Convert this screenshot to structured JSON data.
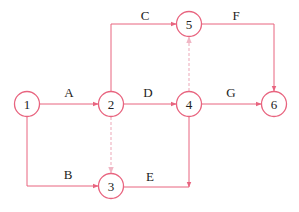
{
  "diagram": {
    "type": "activity-on-arrow network",
    "colors": {
      "stroke": "#e8647f",
      "dummy": "#f0b6c4",
      "text": "#222222"
    },
    "nodes": [
      {
        "id": "1",
        "label": "1",
        "x": 27,
        "y": 104
      },
      {
        "id": "2",
        "label": "2",
        "x": 111,
        "y": 104
      },
      {
        "id": "3",
        "label": "3",
        "x": 111,
        "y": 186
      },
      {
        "id": "4",
        "label": "4",
        "x": 189,
        "y": 104
      },
      {
        "id": "5",
        "label": "5",
        "x": 189,
        "y": 24
      },
      {
        "id": "6",
        "label": "6",
        "x": 274,
        "y": 104
      }
    ],
    "edges": [
      {
        "label": "A",
        "from": "1",
        "to": "2",
        "style": "solid"
      },
      {
        "label": "B",
        "from": "1",
        "to": "3",
        "style": "solid"
      },
      {
        "label": "C",
        "from": "2",
        "to": "5",
        "style": "solid"
      },
      {
        "label": "D",
        "from": "2",
        "to": "4",
        "style": "solid"
      },
      {
        "label": "E",
        "from": "3",
        "to": "4",
        "style": "solid"
      },
      {
        "label": "F",
        "from": "5",
        "to": "6",
        "style": "solid"
      },
      {
        "label": "G",
        "from": "4",
        "to": "6",
        "style": "solid"
      },
      {
        "label": "",
        "from": "2",
        "to": "3",
        "style": "dashed"
      },
      {
        "label": "",
        "from": "4",
        "to": "5",
        "style": "dashed"
      }
    ]
  }
}
